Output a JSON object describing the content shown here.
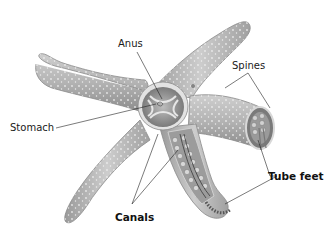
{
  "diagram": {
    "labels": {
      "anus": "Anus",
      "spines": "Spines",
      "stomach": "Stomach",
      "tube_feet": "Tube feet",
      "canals": "Canals"
    },
    "colors": {
      "body": "#a9a9a9",
      "body_light": "#d6d6d6",
      "body_dark": "#6f6f6f",
      "leader_line": "#222222",
      "background": "#ffffff"
    }
  }
}
